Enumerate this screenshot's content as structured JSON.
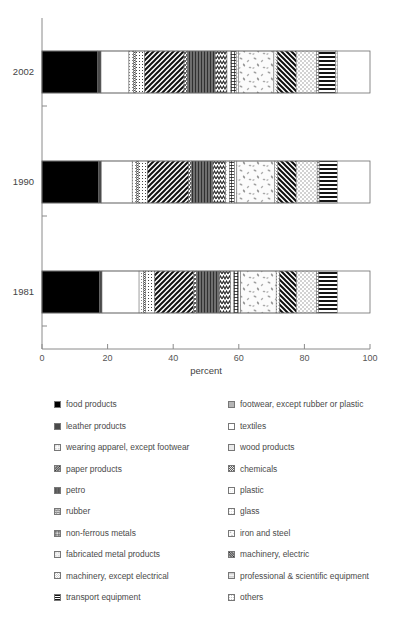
{
  "chart_data": {
    "type": "bar",
    "orientation": "horizontal-stacked",
    "title": "",
    "xlabel": "percent",
    "ylabel": "",
    "xlim": [
      0,
      100
    ],
    "xticks": [
      "0",
      "20",
      "40",
      "60",
      "80",
      "100"
    ],
    "grid": false,
    "legend_position": "below",
    "categories": [
      "2002",
      "1990",
      "1981"
    ],
    "series": [
      {
        "name": "food products",
        "key": "food",
        "values": [
          17.0,
          17.3,
          17.5
        ]
      },
      {
        "name": "leather products",
        "key": "leather",
        "values": [
          1.0,
          0.8,
          0.8
        ]
      },
      {
        "name": "textiles",
        "key": "textiles",
        "values": [
          8.5,
          9.4,
          11.3
        ]
      },
      {
        "name": "wearing apparel, except footwear",
        "key": "apparel",
        "values": [
          1.4,
          1.3,
          1.3
        ]
      },
      {
        "name": "footwear, except rubber or plastic",
        "key": "footwear",
        "values": [
          0.6,
          0.6,
          0.6
        ]
      },
      {
        "name": "wood products",
        "key": "wood",
        "values": [
          2.8,
          2.8,
          2.9
        ]
      },
      {
        "name": "paper products",
        "key": "paper",
        "values": [
          12.0,
          12.5,
          11.8
        ]
      },
      {
        "name": "chemicals",
        "key": "chemicals",
        "values": [
          1.0,
          0.9,
          0.9
        ]
      },
      {
        "name": "petro",
        "key": "petro",
        "values": [
          8.5,
          6.5,
          7.0
        ]
      },
      {
        "name": "rubber",
        "key": "rubber",
        "values": [
          3.6,
          3.9,
          3.4
        ]
      },
      {
        "name": "plastic",
        "key": "plastic",
        "values": [
          1.2,
          1.1,
          1.0
        ]
      },
      {
        "name": "non-ferrous metals",
        "key": "nonferrous",
        "values": [
          1.6,
          1.6,
          1.4
        ]
      },
      {
        "name": "glass",
        "key": "glass",
        "values": [
          0.7,
          0.7,
          0.7
        ]
      },
      {
        "name": "iron and steel",
        "key": "ironsteel",
        "values": [
          10.8,
          11.5,
          10.8
        ]
      },
      {
        "name": "fabricated metal products",
        "key": "fabmetal",
        "values": [
          1.0,
          1.0,
          1.0
        ]
      },
      {
        "name": "machinery, electric",
        "key": "machelec",
        "values": [
          5.8,
          5.6,
          5.2
        ]
      },
      {
        "name": "machinery, except electrical",
        "key": "machexcept",
        "values": [
          6.2,
          6.4,
          6.1
        ]
      },
      {
        "name": "professional & scientific equipment",
        "key": "prof",
        "values": [
          0.7,
          0.6,
          0.6
        ]
      },
      {
        "name": "transport equipment",
        "key": "transport",
        "values": [
          5.1,
          5.5,
          5.7
        ]
      },
      {
        "name": "others",
        "key": "others",
        "values": [
          0.5,
          0.0,
          0.0
        ]
      }
    ]
  },
  "axis": {
    "x_title": "percent",
    "ticks": [
      "0",
      "20",
      "40",
      "60",
      "80",
      "100"
    ]
  },
  "years": [
    "2002",
    "1990",
    "1981"
  ],
  "legend": {
    "left_column": [
      "food products",
      "leather products",
      "wearing apparel, except footwear",
      "paper products",
      "petro",
      "rubber",
      "non-ferrous metals",
      "fabricated metal products",
      "machinery, except electrical",
      "transport equipment"
    ],
    "right_column": [
      "footwear, except rubber or plastic",
      "textiles",
      "wood products",
      "chemicals",
      "plastic",
      "glass",
      "iron and steel",
      "machinery, electric",
      "professional & scientific equipment",
      "others"
    ],
    "left_keys": [
      "food",
      "leather",
      "apparel",
      "paper",
      "petro",
      "rubber",
      "nonferrous",
      "fabmetal",
      "machexcept",
      "transport"
    ],
    "right_keys": [
      "footwear",
      "textiles",
      "wood",
      "chemicals",
      "plastic",
      "glass",
      "ironsteel",
      "machelec",
      "prof",
      "others"
    ]
  },
  "colors": {
    "axis": "#8a8a8a",
    "outline": "#6b6b6b",
    "text": "#4a4a4a",
    "food": "#000000",
    "leather": "#4a4a4a",
    "textiles": "#ffffff",
    "petro": "#6e6e6e"
  }
}
